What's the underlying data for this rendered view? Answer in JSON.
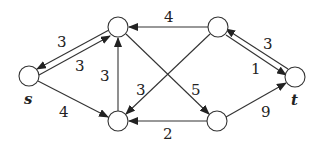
{
  "diagram": {
    "type": "directed-flow-network",
    "stroke_color": "#333333",
    "nodes": [
      {
        "id": "s",
        "label": "s",
        "x": 29,
        "y": 76
      },
      {
        "id": "a",
        "label": "",
        "x": 118,
        "y": 27
      },
      {
        "id": "b",
        "label": "",
        "x": 118,
        "y": 121
      },
      {
        "id": "c",
        "label": "",
        "x": 218,
        "y": 27
      },
      {
        "id": "d",
        "label": "",
        "x": 217,
        "y": 121
      },
      {
        "id": "t",
        "label": "t",
        "x": 295,
        "y": 77
      }
    ],
    "edges": [
      {
        "from": "a",
        "to": "s",
        "label": "3"
      },
      {
        "from": "s",
        "to": "a",
        "label": "3"
      },
      {
        "from": "s",
        "to": "b",
        "label": "4"
      },
      {
        "from": "b",
        "to": "a",
        "label": "3"
      },
      {
        "from": "c",
        "to": "a",
        "label": "4"
      },
      {
        "from": "c",
        "to": "b",
        "label": "3"
      },
      {
        "from": "a",
        "to": "d",
        "label": "5"
      },
      {
        "from": "d",
        "to": "b",
        "label": "2"
      },
      {
        "from": "t",
        "to": "c",
        "label": "3"
      },
      {
        "from": "c",
        "to": "t",
        "label": "1"
      },
      {
        "from": "d",
        "to": "t",
        "label": "9"
      }
    ]
  }
}
